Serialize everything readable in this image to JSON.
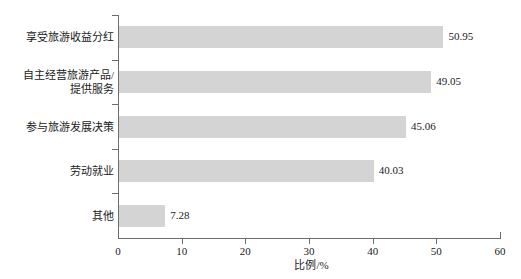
{
  "chart_data": {
    "type": "bar",
    "orientation": "horizontal",
    "title": "",
    "subtitle": "",
    "xlabel": "比例/%",
    "ylabel": "",
    "xlim": [
      0,
      60
    ],
    "xticks": [
      0,
      10,
      20,
      30,
      40,
      50,
      60
    ],
    "xtick_labels": [
      "0",
      "10",
      "20",
      "30",
      "40",
      "50",
      "60"
    ],
    "grid": false,
    "legend": null,
    "bar_color": "#d4d4d4",
    "axis_color": "#6d6d6d",
    "text_color": "#1a1a1a",
    "categories": [
      "享受旅游收益分红",
      "自主经营旅游产品/\n提供服务",
      "参与旅游发展决策",
      "劳动就业",
      "其他"
    ],
    "values": [
      50.95,
      49.05,
      45.06,
      40.03,
      7.28
    ],
    "value_labels": [
      "50.95",
      "49.05",
      "45.06",
      "40.03",
      "7.28"
    ]
  }
}
